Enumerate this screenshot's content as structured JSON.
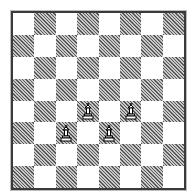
{
  "game": {
    "type": "chess",
    "board_size": 8,
    "top_left_square": "light",
    "colors": {
      "light_square": "#ffffff",
      "dark_square_hatch_fg": "#5a5a5a",
      "dark_square_hatch_bg": "#c8c8c8",
      "frame": "#3a3a3a",
      "piece_fill": "#ffffff",
      "piece_outline": "#000000"
    },
    "pieces": [
      {
        "row": 4,
        "col": 3,
        "type": "pawn",
        "color": "white",
        "icon": "white-pawn-icon"
      },
      {
        "row": 4,
        "col": 5,
        "type": "pawn",
        "color": "white",
        "icon": "white-pawn-icon"
      },
      {
        "row": 5,
        "col": 2,
        "type": "pawn",
        "color": "white",
        "icon": "white-pawn-icon"
      },
      {
        "row": 5,
        "col": 4,
        "type": "pawn",
        "color": "white",
        "icon": "white-pawn-icon"
      }
    ]
  }
}
